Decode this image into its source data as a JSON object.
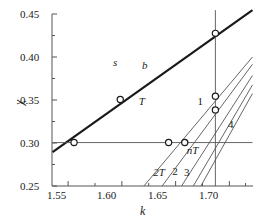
{
  "chart_data": {
    "type": "line",
    "title": "",
    "subtitle": "",
    "xlabel": "k",
    "ylabel": "χ",
    "xlim": [
      1.535,
      1.722
    ],
    "ylim": [
      0.25,
      0.45
    ],
    "grid": false,
    "legend": "none",
    "x_ticks": [
      1.55,
      1.6,
      1.65,
      1.7
    ],
    "x_tick_labels": [
      "1.55",
      "1.60",
      "1.65",
      "1.70"
    ],
    "x_minor_ticks": [
      1.575,
      1.625,
      1.675,
      1.715
    ],
    "y_ticks": [
      0.25,
      0.3,
      0.35,
      0.4,
      0.45
    ],
    "y_tick_labels": [
      "0.25",
      "0.30",
      "0.35",
      "0.40",
      "0.45"
    ],
    "y_minor_ticks": [
      0.275,
      0.325,
      0.375,
      0.425
    ],
    "series": [
      {
        "name": "b",
        "style": "bold",
        "color": "#1a1a1a",
        "width": 2.2,
        "points": [
          [
            1.5355,
            0.2895
          ],
          [
            1.7215,
            0.4545
          ]
        ]
      },
      {
        "name": "horizontal-chi-0.30",
        "style": "thin",
        "color": "#555555",
        "width": 0.9,
        "points": [
          [
            1.5355,
            0.3005
          ],
          [
            1.7215,
            0.3005
          ]
        ]
      },
      {
        "name": "vertical-k-1.687",
        "style": "thin",
        "color": "#555555",
        "width": 0.9,
        "points": [
          [
            1.687,
            0.25
          ],
          [
            1.687,
            0.4545
          ]
        ]
      },
      {
        "name": "2T",
        "style": "thin",
        "color": "#555555",
        "width": 0.9,
        "points": [
          [
            1.6205,
            0.25
          ],
          [
            1.7215,
            0.4
          ]
        ]
      },
      {
        "name": "2",
        "style": "thin",
        "color": "#555555",
        "width": 0.9,
        "points": [
          [
            1.6375,
            0.25
          ],
          [
            1.7215,
            0.3915
          ]
        ]
      },
      {
        "name": "3",
        "style": "thin",
        "color": "#555555",
        "width": 0.9,
        "points": [
          [
            1.6555,
            0.25
          ],
          [
            1.7215,
            0.3785
          ]
        ]
      },
      {
        "name": "4a",
        "style": "thin",
        "color": "#555555",
        "width": 0.9,
        "points": [
          [
            1.6665,
            0.25
          ],
          [
            1.7215,
            0.3675
          ]
        ]
      },
      {
        "name": "4b",
        "style": "thin",
        "color": "#555555",
        "width": 0.9,
        "points": [
          [
            1.6735,
            0.25
          ],
          [
            1.7215,
            0.3575
          ]
        ]
      }
    ],
    "markers": [
      {
        "label": "m1",
        "x": 1.5555,
        "y": 0.3005
      },
      {
        "label": "m2",
        "x": 1.5985,
        "y": 0.3505
      },
      {
        "label": "m3",
        "x": 1.6435,
        "y": 0.3005
      },
      {
        "label": "m4",
        "x": 1.6585,
        "y": 0.3005
      },
      {
        "label": "m5",
        "x": 1.687,
        "y": 0.4275
      },
      {
        "label": "m6",
        "x": 1.687,
        "y": 0.3545
      },
      {
        "label": "m7",
        "x": 1.687,
        "y": 0.3385
      }
    ],
    "annotations": [
      {
        "text": "s",
        "x": 1.5955,
        "y": 0.3935,
        "italic": true
      },
      {
        "text": "b",
        "x": 1.6225,
        "y": 0.39,
        "italic": true
      },
      {
        "text": "T",
        "x": 1.6195,
        "y": 0.348,
        "italic": true
      },
      {
        "text": "1",
        "x": 1.674,
        "y": 0.348,
        "italic": false
      },
      {
        "text": "4",
        "x": 1.7025,
        "y": 0.3215,
        "italic": false
      },
      {
        "text": "nT",
        "x": 1.664,
        "y": 0.291,
        "italic": true
      },
      {
        "text": "2T",
        "x": 1.633,
        "y": 0.265,
        "italic": true
      },
      {
        "text": "2",
        "x": 1.6505,
        "y": 0.2665,
        "italic": false
      },
      {
        "text": "3",
        "x": 1.6615,
        "y": 0.265,
        "italic": false
      }
    ]
  },
  "axes": {
    "x_axis_title": "k",
    "y_axis_title": "χ",
    "x_tick_labels": [
      "1.55",
      "1.60",
      "1.65",
      "1.70"
    ],
    "y_tick_labels": [
      "0.45",
      "0.40",
      "0.35",
      "0.30",
      "0.25"
    ]
  },
  "colors": {
    "axis": "#555555",
    "bold_line": "#1a1a1a",
    "thin_line": "#555555",
    "text": "#1a1a1a",
    "background": "#ffffff"
  }
}
